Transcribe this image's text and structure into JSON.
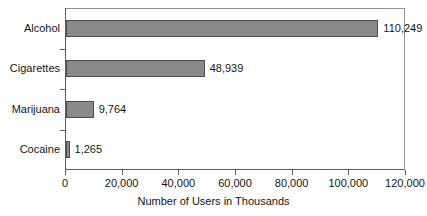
{
  "chart_data": {
    "type": "bar",
    "orientation": "horizontal",
    "title": "",
    "xlabel": "Number of Users in Thousands",
    "ylabel": "",
    "categories": [
      "Alcohol",
      "Cigarettes",
      "Marijuana",
      "Cocaine"
    ],
    "values": [
      110249,
      48939,
      9764,
      1265
    ],
    "value_labels": [
      "110,249",
      "48,939",
      "9,764",
      "1,265"
    ],
    "xlim": [
      0,
      120000
    ],
    "xticks": [
      0,
      20000,
      40000,
      60000,
      80000,
      100000,
      120000
    ],
    "xtick_labels": [
      "0",
      "20,000",
      "40,000",
      "60,000",
      "80,000",
      "100,000",
      "120,000"
    ],
    "grid": false,
    "legend": null,
    "bar_fill_color": "#8a8a8a",
    "bar_edge_color": "#4b4b4b",
    "axis_color": "#5c5f61",
    "frame_color": "#8f9295",
    "background_color": "#ffffff"
  }
}
